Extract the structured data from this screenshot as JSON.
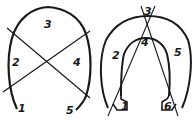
{
  "diagrams": [
    {
      "name": "horseshoe-cut-simple",
      "labels": [
        "1",
        "2",
        "3",
        "4",
        "5"
      ]
    },
    {
      "name": "horseshoe-cut-thick",
      "labels": [
        "1",
        "2",
        "3",
        "4",
        "5",
        "6"
      ]
    }
  ],
  "colors": {
    "stroke": "#1a1a1a",
    "background": "#ffffff"
  }
}
